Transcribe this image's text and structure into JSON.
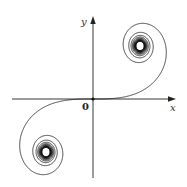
{
  "figure": {
    "axes": {
      "x_label": "x",
      "y_label": "y",
      "origin_label": "0"
    },
    "colors": {
      "curve": "#111111",
      "axes": "#222222",
      "background": "#ffffff"
    },
    "curve": {
      "type": "clothoid",
      "parametric": "x = C(t), y = S(t) (Fresnel integrals)",
      "t_range": [
        -7.5,
        7.5
      ],
      "limit_points": [
        [
          0.5,
          0.5
        ],
        [
          -0.5,
          -0.5
        ]
      ]
    }
  }
}
